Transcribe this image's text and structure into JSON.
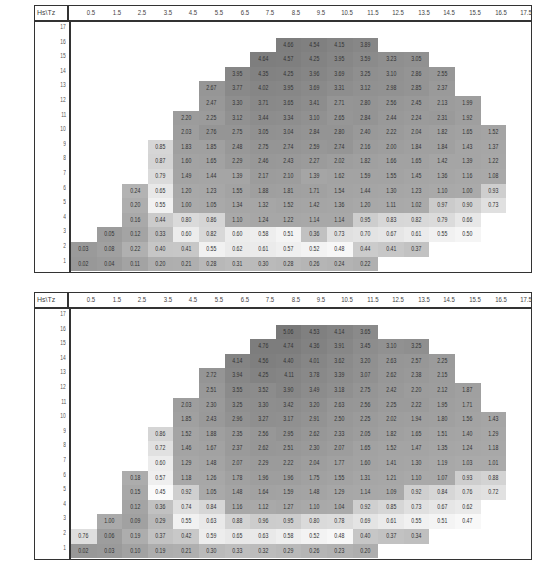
{
  "chart_data": [
    {
      "type": "heatmap",
      "title": "",
      "corner_label": "Hs\\Tz",
      "xlabel": "Tz",
      "ylabel": "Hs",
      "x": [
        "0.5",
        "1.5",
        "2.5",
        "3.5",
        "4.5",
        "5.5",
        "6.5",
        "7.5",
        "8.5",
        "9.5",
        "10.5",
        "11.5",
        "12.5",
        "13.5",
        "14.5",
        "15.5",
        "16.5",
        "17.5"
      ],
      "y": [
        "17",
        "16",
        "15",
        "14",
        "13",
        "12",
        "11",
        "10",
        "9",
        "8",
        "7",
        "6",
        "5",
        "4",
        "3",
        "2",
        "1"
      ],
      "rows": [
        {
          "hs": "17",
          "start": 0,
          "values": []
        },
        {
          "hs": "16",
          "start": 8,
          "values": [
            4.66,
            4.54,
            4.15,
            3.89
          ]
        },
        {
          "hs": "15",
          "start": 7,
          "values": [
            4.64,
            4.57,
            4.25,
            3.95,
            3.59,
            3.23,
            3.05
          ]
        },
        {
          "hs": "14",
          "start": 6,
          "values": [
            3.95,
            4.35,
            4.25,
            3.96,
            3.69,
            3.25,
            3.1,
            2.86,
            2.55
          ]
        },
        {
          "hs": "13",
          "start": 5,
          "values": [
            2.67,
            3.77,
            4.02,
            3.95,
            3.69,
            3.31,
            3.12,
            2.98,
            2.85,
            2.37
          ]
        },
        {
          "hs": "12",
          "start": 5,
          "values": [
            2.47,
            3.3,
            3.71,
            3.65,
            3.41,
            2.71,
            2.8,
            2.56,
            2.45,
            2.13,
            1.99
          ]
        },
        {
          "hs": "11",
          "start": 4,
          "values": [
            2.2,
            2.25,
            3.12,
            3.44,
            3.34,
            3.1,
            2.65,
            2.84,
            2.44,
            2.24,
            2.31,
            1.92
          ]
        },
        {
          "hs": "10",
          "start": 4,
          "values": [
            2.03,
            2.76,
            2.75,
            3.05,
            3.04,
            2.84,
            2.8,
            2.4,
            2.22,
            2.04,
            1.82,
            1.65,
            1.52
          ]
        },
        {
          "hs": "9",
          "start": 3,
          "values": [
            0.85,
            1.83,
            1.85,
            2.48,
            2.75,
            2.74,
            2.59,
            2.74,
            2.16,
            2.0,
            1.84,
            1.84,
            1.43,
            1.37
          ]
        },
        {
          "hs": "8",
          "start": 3,
          "values": [
            0.87,
            1.6,
            1.65,
            2.29,
            2.46,
            2.43,
            2.27,
            2.02,
            1.82,
            1.66,
            1.65,
            1.42,
            1.39,
            1.22
          ]
        },
        {
          "hs": "7",
          "start": 3,
          "values": [
            0.79,
            1.49,
            1.44,
            1.39,
            2.17,
            2.1,
            1.39,
            1.62,
            1.59,
            1.55,
            1.45,
            1.36,
            1.16,
            1.08
          ]
        },
        {
          "hs": "6",
          "start": 2,
          "values": [
            0.24,
            0.65,
            1.2,
            1.23,
            1.55,
            1.88,
            1.81,
            1.71,
            1.54,
            1.44,
            1.3,
            1.23,
            1.1,
            1.0,
            0.93
          ]
        },
        {
          "hs": "5",
          "start": 2,
          "values": [
            0.2,
            0.55,
            1.0,
            1.05,
            1.34,
            1.32,
            1.52,
            1.42,
            1.36,
            1.2,
            1.11,
            1.02,
            0.97,
            0.9,
            0.73
          ]
        },
        {
          "hs": "4",
          "start": 2,
          "values": [
            0.16,
            0.44,
            0.8,
            0.86,
            1.1,
            1.24,
            1.22,
            1.14,
            1.14,
            0.95,
            0.83,
            0.82,
            0.79,
            0.66
          ]
        },
        {
          "hs": "3",
          "start": 1,
          "values": [
            0.05,
            0.12,
            0.33,
            0.6,
            0.82,
            0.6,
            0.58,
            0.51,
            0.36,
            0.73,
            0.7,
            0.67,
            0.61,
            0.55,
            0.5
          ]
        },
        {
          "hs": "2",
          "start": 0,
          "values": [
            0.03,
            0.08,
            0.22,
            0.4,
            0.41,
            0.55,
            0.62,
            0.61,
            0.57,
            0.52,
            0.48,
            0.44,
            0.41,
            0.37
          ]
        },
        {
          "hs": "1",
          "start": 0,
          "values": [
            0.02,
            0.04,
            0.11,
            0.2,
            0.21,
            0.28,
            0.31,
            0.3,
            0.28,
            0.26,
            0.24,
            0.22
          ]
        }
      ],
      "grid": true,
      "colormap": "grayscale"
    },
    {
      "type": "heatmap",
      "title": "",
      "corner_label": "Hs\\Tz",
      "xlabel": "Tz",
      "ylabel": "Hs",
      "x": [
        "0.5",
        "1.5",
        "2.5",
        "3.5",
        "4.5",
        "5.5",
        "6.5",
        "7.5",
        "8.5",
        "9.5",
        "10.5",
        "11.5",
        "12.5",
        "13.5",
        "14.5",
        "15.5",
        "16.5",
        "17.5"
      ],
      "y": [
        "17",
        "16",
        "15",
        "14",
        "13",
        "12",
        "11",
        "10",
        "9",
        "8",
        "7",
        "6",
        "5",
        "4",
        "3",
        "2",
        "1"
      ],
      "rows": [
        {
          "hs": "17",
          "start": 0,
          "values": []
        },
        {
          "hs": "16",
          "start": 8,
          "values": [
            5.06,
            4.53,
            4.14,
            3.65
          ]
        },
        {
          "hs": "15",
          "start": 7,
          "values": [
            4.76,
            4.74,
            4.36,
            3.91,
            3.45,
            3.1,
            3.25
          ]
        },
        {
          "hs": "14",
          "start": 6,
          "values": [
            4.14,
            4.56,
            4.4,
            4.01,
            3.62,
            3.2,
            2.63,
            2.57,
            2.25
          ]
        },
        {
          "hs": "13",
          "start": 5,
          "values": [
            2.72,
            3.94,
            4.25,
            4.11,
            3.78,
            3.39,
            3.07,
            2.62,
            2.38,
            2.15
          ]
        },
        {
          "hs": "12",
          "start": 5,
          "values": [
            2.51,
            3.55,
            3.52,
            3.9,
            3.49,
            3.18,
            2.75,
            2.42,
            2.2,
            2.12,
            1.87
          ]
        },
        {
          "hs": "11",
          "start": 4,
          "values": [
            2.03,
            2.3,
            3.25,
            3.3,
            3.42,
            3.2,
            2.63,
            2.56,
            2.25,
            2.22,
            1.95,
            1.71
          ]
        },
        {
          "hs": "10",
          "start": 4,
          "values": [
            1.85,
            2.43,
            2.96,
            3.27,
            3.17,
            2.91,
            2.5,
            2.25,
            2.02,
            1.94,
            1.8,
            1.56,
            1.43
          ]
        },
        {
          "hs": "9",
          "start": 3,
          "values": [
            0.86,
            1.52,
            1.88,
            2.35,
            2.56,
            2.95,
            2.62,
            2.33,
            2.05,
            1.82,
            1.65,
            1.51,
            1.4,
            1.29
          ]
        },
        {
          "hs": "8",
          "start": 3,
          "values": [
            0.72,
            1.46,
            1.67,
            2.37,
            2.62,
            2.51,
            2.3,
            2.07,
            1.65,
            1.52,
            1.47,
            1.35,
            1.24,
            1.18
          ]
        },
        {
          "hs": "7",
          "start": 3,
          "values": [
            0.6,
            1.29,
            1.48,
            2.07,
            2.29,
            2.22,
            2.04,
            1.77,
            1.6,
            1.41,
            1.3,
            1.19,
            1.03,
            1.01
          ]
        },
        {
          "hs": "6",
          "start": 2,
          "values": [
            0.18,
            0.57,
            1.18,
            1.26,
            1.78,
            1.96,
            1.96,
            1.75,
            1.55,
            1.31,
            1.21,
            1.1,
            1.07,
            0.93,
            0.88
          ]
        },
        {
          "hs": "5",
          "start": 2,
          "values": [
            0.15,
            0.45,
            0.92,
            1.05,
            1.48,
            1.64,
            1.59,
            1.48,
            1.29,
            1.14,
            1.09,
            0.92,
            0.84,
            0.76,
            0.72
          ]
        },
        {
          "hs": "4",
          "start": 2,
          "values": [
            0.12,
            0.36,
            0.74,
            0.84,
            1.16,
            1.12,
            1.27,
            1.1,
            1.04,
            0.92,
            0.85,
            0.73,
            0.67,
            0.62
          ]
        },
        {
          "hs": "3",
          "start": 1,
          "values": [
            1.0,
            0.09,
            0.29,
            0.55,
            0.63,
            0.88,
            0.96,
            0.95,
            0.8,
            0.78,
            0.69,
            0.61,
            0.55,
            0.51,
            0.47
          ]
        },
        {
          "hs": "2",
          "start": 0,
          "values": [
            0.76,
            0.06,
            0.19,
            0.37,
            0.42,
            0.59,
            0.65,
            0.63,
            0.58,
            0.52,
            0.48,
            0.4,
            0.37,
            0.34
          ]
        },
        {
          "hs": "1",
          "start": 0,
          "values": [
            0.02,
            0.03,
            0.1,
            0.19,
            0.21,
            0.3,
            0.33,
            0.32,
            0.29,
            0.26,
            0.23,
            0.2
          ]
        }
      ],
      "grid": true,
      "colormap": "grayscale"
    }
  ]
}
